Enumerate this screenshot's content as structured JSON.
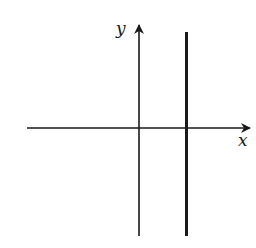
{
  "diagram": {
    "type": "coordinate-axes",
    "x_axis_label": "x",
    "y_axis_label": "y",
    "vertical_line": {
      "description": "vertical line x = a, with a > 0",
      "style": "thick"
    },
    "colors": {
      "ink": "#1a1a1a",
      "background": "#ffffff"
    }
  }
}
